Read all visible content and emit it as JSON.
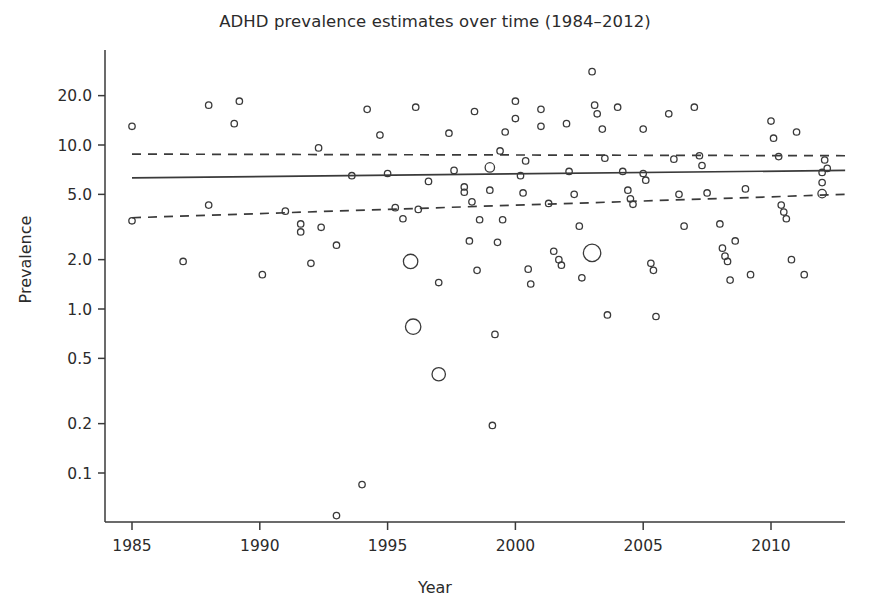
{
  "chart_data": {
    "type": "scatter",
    "title": "ADHD prevalence estimates over time (1984–2012)",
    "xlabel": "Year",
    "ylabel": "Prevalence",
    "xlim": [
      1984,
      2012.9
    ],
    "ylim": [
      0.045,
      30
    ],
    "yscale": "log",
    "grid": false,
    "legend": null,
    "xticks": [
      1985,
      1990,
      1995,
      2000,
      2005,
      2010
    ],
    "xtick_labels": [
      "1985",
      "1990",
      "1995",
      "2000",
      "2005",
      "2010"
    ],
    "yticks": [
      0.1,
      0.2,
      0.5,
      1.0,
      2.0,
      5.0,
      10.0,
      20.0
    ],
    "ytick_labels": [
      "0.1",
      "0.2",
      "0.5",
      "1.0",
      "2.0",
      "5.0",
      "10.0",
      "20.0"
    ],
    "marker": "open-circle",
    "marker_color": "#3a3a3a",
    "points": [
      {
        "x": 1985.0,
        "y": 13.0,
        "size": 4
      },
      {
        "x": 1985.0,
        "y": 3.45,
        "size": 4
      },
      {
        "x": 1987.0,
        "y": 1.95,
        "size": 4
      },
      {
        "x": 1988.0,
        "y": 17.5,
        "size": 4
      },
      {
        "x": 1988.0,
        "y": 4.3,
        "size": 4
      },
      {
        "x": 1989.0,
        "y": 13.5,
        "size": 4
      },
      {
        "x": 1989.2,
        "y": 18.5,
        "size": 4
      },
      {
        "x": 1990.1,
        "y": 1.62,
        "size": 4
      },
      {
        "x": 1991.0,
        "y": 3.95,
        "size": 4
      },
      {
        "x": 1991.6,
        "y": 3.3,
        "size": 4
      },
      {
        "x": 1991.6,
        "y": 2.95,
        "size": 4
      },
      {
        "x": 1992.0,
        "y": 1.9,
        "size": 4
      },
      {
        "x": 1992.3,
        "y": 9.6,
        "size": 4
      },
      {
        "x": 1992.4,
        "y": 3.15,
        "size": 4
      },
      {
        "x": 1993.0,
        "y": 0.055,
        "size": 4
      },
      {
        "x": 1993.0,
        "y": 2.45,
        "size": 4
      },
      {
        "x": 1993.6,
        "y": 6.5,
        "size": 4
      },
      {
        "x": 1994.0,
        "y": 0.085,
        "size": 4
      },
      {
        "x": 1994.2,
        "y": 16.5,
        "size": 4
      },
      {
        "x": 1994.7,
        "y": 11.5,
        "size": 4
      },
      {
        "x": 1995.0,
        "y": 6.7,
        "size": 4
      },
      {
        "x": 1995.3,
        "y": 4.15,
        "size": 4
      },
      {
        "x": 1995.6,
        "y": 3.55,
        "size": 4
      },
      {
        "x": 1995.9,
        "y": 1.95,
        "size": 12
      },
      {
        "x": 1996.0,
        "y": 0.78,
        "size": 13
      },
      {
        "x": 1996.1,
        "y": 17.0,
        "size": 4
      },
      {
        "x": 1996.2,
        "y": 4.05,
        "size": 4
      },
      {
        "x": 1996.6,
        "y": 6.0,
        "size": 4
      },
      {
        "x": 1997.0,
        "y": 0.4,
        "size": 11
      },
      {
        "x": 1997.0,
        "y": 1.45,
        "size": 4
      },
      {
        "x": 1997.4,
        "y": 11.8,
        "size": 4
      },
      {
        "x": 1997.6,
        "y": 7.0,
        "size": 4
      },
      {
        "x": 1998.0,
        "y": 5.55,
        "size": 4
      },
      {
        "x": 1998.0,
        "y": 5.15,
        "size": 4
      },
      {
        "x": 1998.2,
        "y": 2.6,
        "size": 4
      },
      {
        "x": 1998.3,
        "y": 4.5,
        "size": 4
      },
      {
        "x": 1998.4,
        "y": 16.0,
        "size": 4
      },
      {
        "x": 1998.5,
        "y": 1.72,
        "size": 4
      },
      {
        "x": 1998.6,
        "y": 3.5,
        "size": 4
      },
      {
        "x": 1999.0,
        "y": 7.3,
        "size": 7
      },
      {
        "x": 1999.0,
        "y": 5.3,
        "size": 4
      },
      {
        "x": 1999.1,
        "y": 0.195,
        "size": 4
      },
      {
        "x": 1999.2,
        "y": 0.7,
        "size": 4
      },
      {
        "x": 1999.3,
        "y": 2.55,
        "size": 4
      },
      {
        "x": 1999.4,
        "y": 9.2,
        "size": 4
      },
      {
        "x": 1999.5,
        "y": 3.5,
        "size": 4
      },
      {
        "x": 1999.6,
        "y": 12.0,
        "size": 4
      },
      {
        "x": 2000.0,
        "y": 18.5,
        "size": 4
      },
      {
        "x": 2000.0,
        "y": 14.5,
        "size": 4
      },
      {
        "x": 2000.2,
        "y": 6.5,
        "size": 4
      },
      {
        "x": 2000.3,
        "y": 5.1,
        "size": 4
      },
      {
        "x": 2000.4,
        "y": 8.0,
        "size": 4
      },
      {
        "x": 2000.5,
        "y": 1.75,
        "size": 4
      },
      {
        "x": 2000.6,
        "y": 1.42,
        "size": 4
      },
      {
        "x": 2001.0,
        "y": 16.5,
        "size": 4
      },
      {
        "x": 2001.0,
        "y": 13.0,
        "size": 4
      },
      {
        "x": 2001.3,
        "y": 4.4,
        "size": 4
      },
      {
        "x": 2001.5,
        "y": 2.25,
        "size": 4
      },
      {
        "x": 2001.7,
        "y": 2.0,
        "size": 4
      },
      {
        "x": 2001.8,
        "y": 1.85,
        "size": 4
      },
      {
        "x": 2002.0,
        "y": 13.5,
        "size": 4
      },
      {
        "x": 2002.1,
        "y": 6.9,
        "size": 4
      },
      {
        "x": 2002.3,
        "y": 5.0,
        "size": 4
      },
      {
        "x": 2002.5,
        "y": 3.2,
        "size": 4
      },
      {
        "x": 2002.6,
        "y": 1.55,
        "size": 4
      },
      {
        "x": 2003.0,
        "y": 28.0,
        "size": 4
      },
      {
        "x": 2003.0,
        "y": 2.2,
        "size": 15
      },
      {
        "x": 2003.1,
        "y": 17.5,
        "size": 4
      },
      {
        "x": 2003.2,
        "y": 15.5,
        "size": 4
      },
      {
        "x": 2003.4,
        "y": 12.5,
        "size": 4
      },
      {
        "x": 2003.5,
        "y": 8.3,
        "size": 4
      },
      {
        "x": 2003.6,
        "y": 0.92,
        "size": 4
      },
      {
        "x": 2004.0,
        "y": 17.0,
        "size": 4
      },
      {
        "x": 2004.2,
        "y": 6.9,
        "size": 4
      },
      {
        "x": 2004.4,
        "y": 5.3,
        "size": 4
      },
      {
        "x": 2004.5,
        "y": 4.7,
        "size": 4
      },
      {
        "x": 2004.6,
        "y": 4.35,
        "size": 4
      },
      {
        "x": 2005.0,
        "y": 12.5,
        "size": 4
      },
      {
        "x": 2005.0,
        "y": 6.7,
        "size": 4
      },
      {
        "x": 2005.1,
        "y": 6.1,
        "size": 4
      },
      {
        "x": 2005.3,
        "y": 1.9,
        "size": 4
      },
      {
        "x": 2005.4,
        "y": 1.72,
        "size": 4
      },
      {
        "x": 2005.5,
        "y": 0.9,
        "size": 4
      },
      {
        "x": 2006.0,
        "y": 15.5,
        "size": 4
      },
      {
        "x": 2006.2,
        "y": 8.2,
        "size": 4
      },
      {
        "x": 2006.4,
        "y": 5.0,
        "size": 4
      },
      {
        "x": 2006.6,
        "y": 3.2,
        "size": 4
      },
      {
        "x": 2007.0,
        "y": 17.0,
        "size": 4
      },
      {
        "x": 2007.2,
        "y": 8.6,
        "size": 4
      },
      {
        "x": 2007.3,
        "y": 7.5,
        "size": 4
      },
      {
        "x": 2007.5,
        "y": 5.1,
        "size": 4
      },
      {
        "x": 2008.0,
        "y": 3.3,
        "size": 4
      },
      {
        "x": 2008.1,
        "y": 2.35,
        "size": 4
      },
      {
        "x": 2008.2,
        "y": 2.1,
        "size": 4
      },
      {
        "x": 2008.3,
        "y": 1.95,
        "size": 4
      },
      {
        "x": 2008.4,
        "y": 1.5,
        "size": 4
      },
      {
        "x": 2008.6,
        "y": 2.6,
        "size": 4
      },
      {
        "x": 2009.0,
        "y": 5.4,
        "size": 4
      },
      {
        "x": 2009.2,
        "y": 1.62,
        "size": 4
      },
      {
        "x": 2010.0,
        "y": 14.0,
        "size": 4
      },
      {
        "x": 2010.1,
        "y": 11.0,
        "size": 4
      },
      {
        "x": 2010.3,
        "y": 8.5,
        "size": 4
      },
      {
        "x": 2010.4,
        "y": 4.3,
        "size": 4
      },
      {
        "x": 2010.5,
        "y": 3.9,
        "size": 4
      },
      {
        "x": 2010.6,
        "y": 3.55,
        "size": 4
      },
      {
        "x": 2010.8,
        "y": 2.0,
        "size": 4
      },
      {
        "x": 2011.0,
        "y": 12.0,
        "size": 4
      },
      {
        "x": 2011.3,
        "y": 1.62,
        "size": 4
      },
      {
        "x": 2012.0,
        "y": 6.8,
        "size": 4
      },
      {
        "x": 2012.0,
        "y": 5.9,
        "size": 4
      },
      {
        "x": 2012.0,
        "y": 5.05,
        "size": 6
      },
      {
        "x": 2012.1,
        "y": 8.1,
        "size": 4
      },
      {
        "x": 2012.2,
        "y": 7.2,
        "size": 4
      }
    ],
    "series": [
      {
        "name": "fitted regression line",
        "style": "solid",
        "x": [
          1985.0,
          2012.9
        ],
        "y": [
          6.3,
          7.0
        ]
      },
      {
        "name": "upper confidence bound",
        "style": "dashed",
        "x": [
          1985.0,
          2012.9
        ],
        "y": [
          8.8,
          8.6
        ]
      },
      {
        "name": "lower confidence bound",
        "style": "dashed",
        "x": [
          1985.0,
          2012.9
        ],
        "y": [
          3.6,
          5.0
        ]
      }
    ]
  }
}
